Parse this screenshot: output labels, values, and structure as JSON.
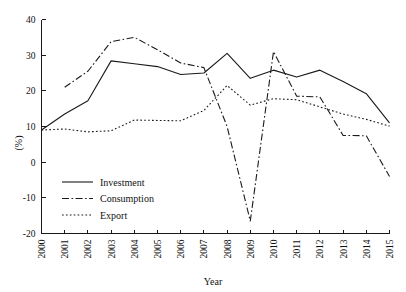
{
  "chart_data": {
    "type": "line",
    "title": "",
    "xlabel": "Year",
    "ylabel": "(%)",
    "ylim": [
      -20,
      40
    ],
    "yticks": [
      -20,
      -10,
      0,
      10,
      20,
      30,
      40
    ],
    "ytick_labels": [
      "-20",
      "-10",
      "0",
      "10",
      "20",
      "30",
      "40"
    ],
    "grid": false,
    "legend_position": "lower-left-inside",
    "x": [
      2000,
      2001,
      2002,
      2003,
      2004,
      2005,
      2006,
      2007,
      2008,
      2009,
      2010,
      2011,
      2012,
      2013,
      2014,
      2015
    ],
    "categories": [
      "2000",
      "2001",
      "2002",
      "2003",
      "2004",
      "2005",
      "2006",
      "2007",
      "2008",
      "2009",
      "2010",
      "2011",
      "2012",
      "2013",
      "2014",
      "2015"
    ],
    "series": [
      {
        "name": "Investment",
        "style": "solid",
        "values": [
          9.0,
          13.5,
          17.2,
          28.4,
          27.6,
          26.8,
          24.6,
          25.0,
          30.5,
          23.5,
          25.8,
          23.9,
          25.8,
          22.6,
          19.2,
          11.0
        ]
      },
      {
        "name": "Consumption",
        "style": "dash-dot",
        "values": [
          null,
          21.0,
          25.5,
          33.8,
          35.0,
          31.5,
          27.8,
          26.5,
          10.0,
          -16.5,
          31.0,
          18.5,
          18.3,
          7.5,
          7.4,
          -4.0
        ]
      },
      {
        "name": "Export",
        "style": "dotted",
        "values": [
          9.0,
          9.3,
          8.5,
          8.8,
          11.8,
          11.7,
          11.6,
          14.5,
          21.5,
          16.0,
          17.8,
          17.5,
          15.5,
          13.5,
          12.0,
          10.1
        ]
      }
    ],
    "legend": [
      {
        "label": "Investment",
        "style": "solid"
      },
      {
        "label": "Consumption",
        "style": "dash-dot"
      },
      {
        "label": "Export",
        "style": "dotted"
      }
    ]
  }
}
